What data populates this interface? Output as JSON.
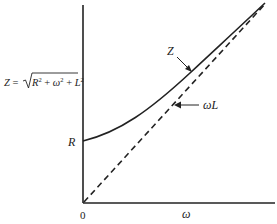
{
  "diagram": {
    "type": "impedance-vs-frequency",
    "formula": {
      "lhs": "Z = ",
      "radicand_R": "R",
      "radicand_plus1": " + ",
      "radicand_w": "ω",
      "radicand_plus2": " + ",
      "radicand_L": "L",
      "exp": "2"
    },
    "y_axis": {
      "label_R": "R"
    },
    "x_axis": {
      "origin_label": "0",
      "label": "ω"
    },
    "curves": [
      {
        "name": "Z",
        "label": "Z",
        "style": "solid",
        "description": "Z = sqrt(R² + ω²L²), starts at R, asymptotically approaches ωL"
      },
      {
        "name": "omegaL",
        "label": "ωL",
        "label_w": "ω",
        "label_L": "L",
        "style": "dashed",
        "description": "straight line through origin"
      }
    ],
    "colors": {
      "ink": "#222222",
      "background": "#ffffff"
    }
  }
}
